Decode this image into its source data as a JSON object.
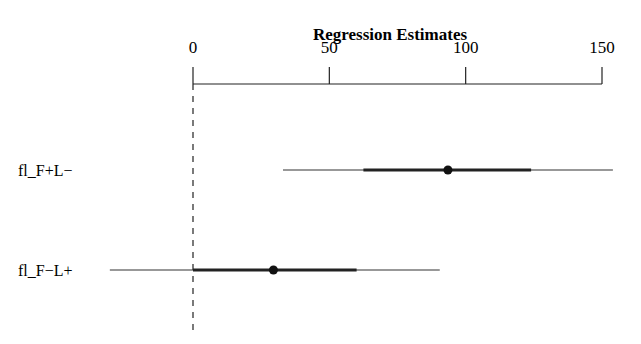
{
  "chart_data": {
    "type": "forest",
    "title": "Regression Estimates",
    "xlabel": "",
    "ylabel": "",
    "xlim": [
      -30,
      155
    ],
    "axis_position": "top",
    "ticks": [
      0,
      50,
      100,
      150
    ],
    "tick_labels": [
      "0",
      "50",
      "100",
      "150"
    ],
    "reference_line": 0,
    "grid": false,
    "legend": null,
    "categories": [
      "fl_F+L−",
      "fl_F−L+"
    ],
    "series": [
      {
        "name": "fl_F+L−",
        "estimate": 93.5,
        "inner_interval": [
          62.5,
          124
        ],
        "outer_interval": [
          33,
          154
        ]
      },
      {
        "name": "fl_F−L+",
        "estimate": 29.5,
        "inner_interval": [
          0,
          60
        ],
        "outer_interval": [
          -30.5,
          90.5
        ]
      }
    ]
  }
}
